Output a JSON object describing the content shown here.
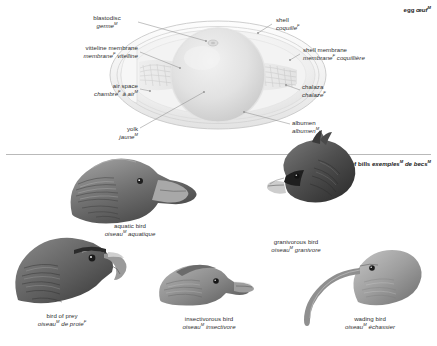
{
  "page": {
    "egg_title": {
      "en": "egg",
      "fr": "œuf",
      "fr_gender": "M"
    },
    "bills_title": {
      "en": "examples of bills",
      "fr": "exemples",
      "fr2": "de becs",
      "g1": "M",
      "g2": "M"
    }
  },
  "egg_diagram": {
    "labels": [
      {
        "id": "blastodisc",
        "en": "blastodisc",
        "fr": "germe",
        "gender": "M",
        "align": "center",
        "x": 76,
        "y": 14,
        "w": 62
      },
      {
        "id": "vitelline-membrane",
        "en": "vitteline membrane",
        "fr": "membrane",
        "gender": "F",
        "fr2": "vitelline",
        "align": "right",
        "x": 28,
        "y": 44,
        "w": 110
      },
      {
        "id": "air-space",
        "en": "air space",
        "fr": "chambre",
        "gender": "F",
        "fr2": "à air",
        "gender2": "M",
        "align": "right",
        "x": 38,
        "y": 82,
        "w": 100
      },
      {
        "id": "yolk",
        "en": "yolk",
        "fr": "jaune",
        "gender": "M",
        "align": "right",
        "x": 68,
        "y": 125,
        "w": 70
      },
      {
        "id": "shell",
        "en": "shell",
        "fr": "coquille",
        "gender": "F",
        "align": "left",
        "x": 276,
        "y": 16,
        "w": 80
      },
      {
        "id": "shell-membrane",
        "en": "shell membrane",
        "fr": "membrane",
        "gender": "F",
        "fr2": "coquillière",
        "align": "left",
        "x": 303,
        "y": 46,
        "w": 120
      },
      {
        "id": "chalaza",
        "en": "chalaza",
        "fr": "chalaze",
        "gender": "F",
        "align": "left",
        "x": 302,
        "y": 83,
        "w": 80
      },
      {
        "id": "albumen",
        "en": "albumen",
        "fr": "albumen",
        "gender": "M",
        "align": "left",
        "x": 292,
        "y": 119,
        "w": 80
      }
    ]
  },
  "bills": {
    "items": [
      {
        "id": "aquatic-bird",
        "en": "aquatic bird",
        "fr": "oiseau",
        "gender": "M",
        "fr2": "aquatique",
        "x": 78,
        "y": 222,
        "w": 104
      },
      {
        "id": "granivorous-bird",
        "en": "granivorous bird",
        "fr": "oiseau",
        "gender": "M",
        "fr2": "granivore",
        "x": 244,
        "y": 238,
        "w": 104
      },
      {
        "id": "bird-of-prey",
        "en": "bird of prey",
        "fr": "oiseau",
        "gender": "M",
        "fr2": "de proie",
        "gender2": "F",
        "x": 8,
        "y": 312,
        "w": 108
      },
      {
        "id": "insectivorous-bird",
        "en": "insectivorous bird",
        "fr": "oiseau",
        "gender": "M",
        "fr2": "insectivore",
        "x": 152,
        "y": 315,
        "w": 114
      },
      {
        "id": "wading-bird",
        "en": "wading bird",
        "fr": "oiseau",
        "gender": "M",
        "fr2": "échassier",
        "x": 318,
        "y": 315,
        "w": 104
      }
    ]
  },
  "colors": {
    "text": "#2e2e2e",
    "leader_line": "#8d8d8d",
    "divider": "#b9b9b9",
    "shell_outline": "#cfcfcf",
    "albumen_fill": "#ececec",
    "yolk_fill": "#dedede",
    "bird_dark": "#4a4a4a",
    "bird_mid": "#8e8e8e",
    "bird_light": "#c9c9c9"
  }
}
